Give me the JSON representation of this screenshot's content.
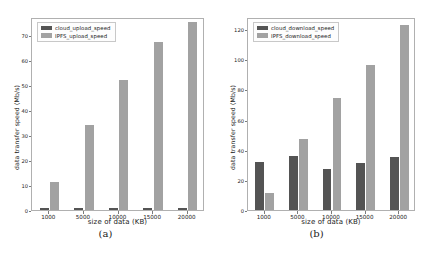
{
  "figure": {
    "panels": [
      {
        "caption": "(a)",
        "xlabel": "size of data (KB)",
        "ylabel": "data transfer speed (Mb/s)"
      },
      {
        "caption": "(b)",
        "xlabel": "size of data (KB)",
        "ylabel": "data transfer speed (Mb/s)"
      }
    ]
  },
  "colors": {
    "dark_series": "#545454",
    "light_series": "#a2a2a2",
    "axis": "#b0b0b0",
    "text": "#1a1a1a",
    "background": "#ffffff"
  },
  "chart_data": [
    {
      "type": "bar",
      "title": "(a)",
      "xlabel": "size of data (KB)",
      "ylabel": "data transfer speed (Mb/s)",
      "categories": [
        "1000",
        "5000",
        "10000",
        "15000",
        "20000"
      ],
      "series": [
        {
          "name": "cloud_upload_speed",
          "color": "#545454",
          "values": [
            1,
            1,
            1,
            1,
            1
          ]
        },
        {
          "name": "IPFS_upload_speed",
          "color": "#a2a2a2",
          "values": [
            11,
            34,
            52,
            67,
            75
          ]
        }
      ],
      "ylim": [
        0,
        77
      ],
      "yticks": [
        0,
        10,
        20,
        30,
        40,
        50,
        60,
        70
      ],
      "grid": false,
      "legend_position": "upper left"
    },
    {
      "type": "bar",
      "title": "(b)",
      "xlabel": "size of data (KB)",
      "ylabel": "data transfer speed (Mb/s)",
      "categories": [
        "1000",
        "5000",
        "10000",
        "15000",
        "20000"
      ],
      "series": [
        {
          "name": "cloud_download_speed",
          "color": "#545454",
          "values": [
            32,
            36,
            27,
            31,
            35
          ]
        },
        {
          "name": "IPFS_download_speed",
          "color": "#a2a2a2",
          "values": [
            11,
            47,
            74,
            96,
            123
          ]
        }
      ],
      "ylim": [
        0,
        128
      ],
      "yticks": [
        0,
        20,
        40,
        60,
        80,
        100,
        120
      ],
      "grid": false,
      "legend_position": "upper left"
    }
  ]
}
